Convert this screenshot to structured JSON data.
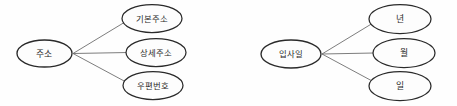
{
  "page": {
    "width": 457,
    "height": 106,
    "background_color": "#fefefe"
  },
  "style": {
    "node_stroke_color": "#2a2a2a",
    "node_fill_color": "#fdfdfd",
    "edge_color": "#6e6e6e",
    "label_color": "#2b2b2b"
  },
  "diagrams": [
    {
      "id": "address-diagram",
      "root": {
        "label": "주소",
        "cx": 44.5,
        "cy": 53.5,
        "rx": 27.5,
        "ry": 13.5
      },
      "fan_point": {
        "x": 73,
        "y": 53.5
      },
      "children": [
        {
          "label": "기본주소",
          "cx": 152,
          "cy": 18.5,
          "rx": 30,
          "ry": 14
        },
        {
          "label": "상세주소",
          "cx": 156,
          "cy": 52.5,
          "rx": 30,
          "ry": 14
        },
        {
          "label": "우편번호",
          "cx": 153,
          "cy": 85.5,
          "rx": 30,
          "ry": 14
        }
      ],
      "edges": [
        {
          "from": "주소",
          "to": "기본주소"
        },
        {
          "from": "주소",
          "to": "상세주소"
        },
        {
          "from": "주소",
          "to": "우편번호"
        }
      ]
    },
    {
      "id": "hiredate-diagram",
      "root": {
        "label": "입사일",
        "cx": 291,
        "cy": 54,
        "rx": 30,
        "ry": 14
      },
      "fan_point": {
        "x": 322,
        "y": 54
      },
      "children": [
        {
          "label": "년",
          "cx": 400,
          "cy": 19,
          "rx": 31,
          "ry": 14.5
        },
        {
          "label": "월",
          "cx": 404,
          "cy": 53,
          "rx": 31,
          "ry": 14.5
        },
        {
          "label": "일",
          "cx": 400,
          "cy": 86,
          "rx": 31,
          "ry": 14.5
        }
      ],
      "edges": [
        {
          "from": "입사일",
          "to": "년"
        },
        {
          "from": "입사일",
          "to": "월"
        },
        {
          "from": "입사일",
          "to": "일"
        }
      ]
    }
  ]
}
